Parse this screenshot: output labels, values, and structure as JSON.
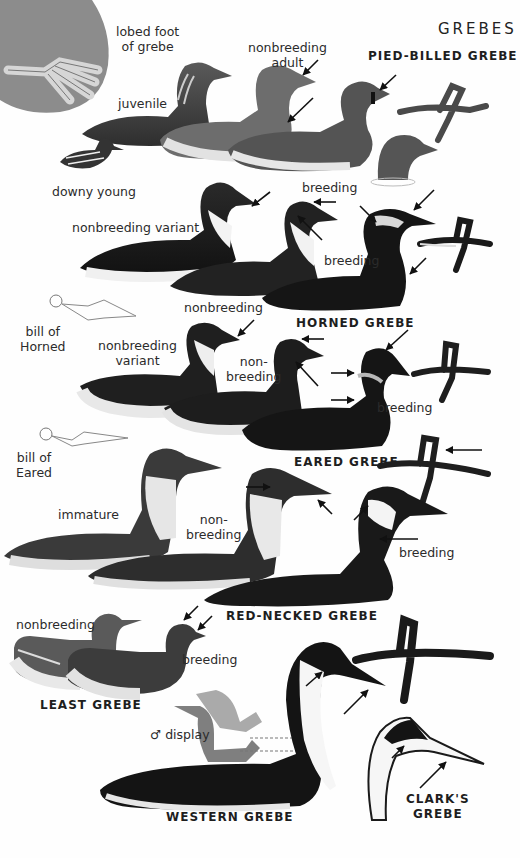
{
  "page": {
    "title": "GREBES",
    "colors": {
      "background": "#fefefe",
      "ink": "#1e1e1e",
      "circle": "#8c8c8c",
      "bird_dark": "#1c1c1c",
      "bird_mid": "#6e6e6e",
      "bird_light": "#dcdcdc",
      "display_gray": "#8a8a8a"
    }
  },
  "foot_inset": {
    "label_line1": "lobed foot",
    "label_line2": "of grebe"
  },
  "species": [
    {
      "name": "PIED-BILLED GREBE",
      "labels": {
        "juvenile": "juvenile",
        "nonbreeding_line1": "nonbreeding",
        "nonbreeding_line2": "adult",
        "downy": "downy young",
        "breeding": "breeding"
      }
    },
    {
      "name": "HORNED GREBE",
      "labels": {
        "variant": "nonbreeding variant",
        "nonbreeding": "nonbreeding",
        "breeding": "breeding"
      },
      "bill_inset": {
        "line1": "bill of",
        "line2": "Horned"
      }
    },
    {
      "name": "EARED GREBE",
      "labels": {
        "variant_line1": "nonbreeding",
        "variant_line2": "variant",
        "nonbreeding_line1": "non-",
        "nonbreeding_line2": "breeding",
        "breeding": "breeding"
      },
      "bill_inset": {
        "line1": "bill of",
        "line2": "Eared"
      }
    },
    {
      "name": "RED-NECKED GREBE",
      "labels": {
        "immature": "immature",
        "nonbreeding_line1": "non-",
        "nonbreeding_line2": "breeding",
        "breeding": "breeding"
      }
    },
    {
      "name": "LEAST GREBE",
      "labels": {
        "nonbreeding": "nonbreeding",
        "breeding": "breeding"
      }
    },
    {
      "name": "WESTERN GREBE",
      "labels": {
        "display": "♂ display"
      }
    },
    {
      "name_line1": "CLARK'S",
      "name_line2": "GREBE"
    }
  ]
}
